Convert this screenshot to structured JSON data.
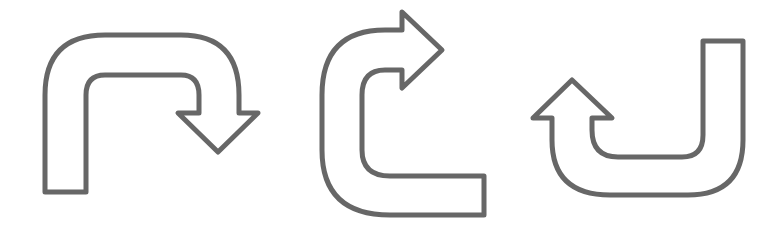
{
  "figure": {
    "stroke_color": "#676767",
    "fill_color": "#ffffff",
    "background": "#ffffff",
    "arrows": [
      {
        "name": "u-turn-arrow-down-right",
        "direction": "down",
        "path": "M 45 192 L 45 95 Q 45 35 105 35 L 181 35 Q 239 35 239 95 L 239 113 L 258 113 L 218 152 L 178 113 L 199 113 L 199 95 Q 199 75 181 75 L 105 75 Q 86 75 86 95 L 86 192 Z"
      },
      {
        "name": "u-turn-arrow-right",
        "direction": "right",
        "path": "M 484 176 L 484 215 L 390 215 Q 322 215 322 150 L 322 95 Q 322 30 385 30 L 402 30 L 402 12 L 442 50 L 402 88 L 402 70 L 385 70 Q 362 70 362 95 L 362 150 Q 362 176 390 176 Z"
      },
      {
        "name": "u-turn-arrow-up-left",
        "direction": "up",
        "path": "M 703 41 L 743 41 L 743 140 Q 743 195 688 195 L 610 195 Q 552 195 552 140 L 552 118 L 533 118 L 572 80 L 612 118 L 592 118 L 592 130 Q 592 157 618 157 L 682 157 Q 703 157 703 135 Z"
      }
    ]
  }
}
